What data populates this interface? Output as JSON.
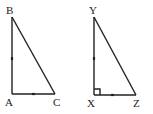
{
  "triangles": [
    {
      "name": "ABC",
      "vertices": {
        "top": "B",
        "corner": "A",
        "right": "C"
      },
      "right_angle_marked": false,
      "congruence_ticks": [
        "AB",
        "AC"
      ]
    },
    {
      "name": "XYZ",
      "vertices": {
        "top": "Y",
        "corner": "X",
        "right": "Z"
      },
      "right_angle_marked": true,
      "congruence_ticks": [
        "XY",
        "XZ"
      ]
    }
  ]
}
